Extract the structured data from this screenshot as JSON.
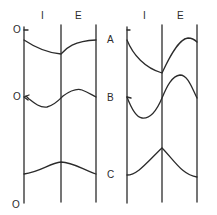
{
  "diagram": {
    "panels": [
      {
        "id": "left",
        "phase_labels": [
          "I",
          "E"
        ],
        "axis_labels": [
          "O",
          "O",
          "O"
        ],
        "curves": [
          {
            "name": "A",
            "description": "declines through inspiration, rises during expiration"
          },
          {
            "name": "B",
            "description": "dips then rises in inspiration, peaks and falls in expiration"
          },
          {
            "name": "C",
            "description": "gentle rise to peak at I/E boundary, then gentle fall"
          }
        ]
      },
      {
        "id": "right",
        "phase_labels": [
          "I",
          "E"
        ],
        "curves": [
          {
            "name": "A",
            "description": "steep decline through inspiration, large rise in expiration"
          },
          {
            "name": "B",
            "description": "deep trough in inspiration, large peak in expiration"
          },
          {
            "name": "C",
            "description": "larger rise to peak at I/E boundary, then fall"
          }
        ]
      }
    ],
    "row_labels": [
      "A",
      "B",
      "C"
    ],
    "colors": {
      "line": "#2b2b2b",
      "background": "#ffffff"
    }
  }
}
